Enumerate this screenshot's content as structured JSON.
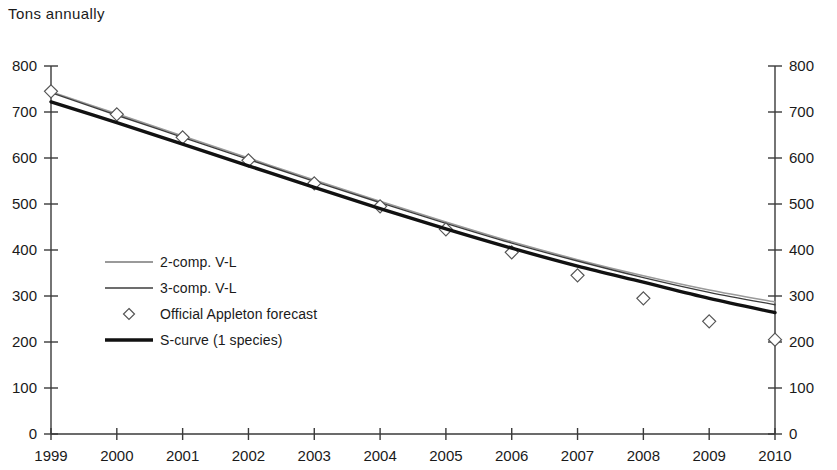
{
  "chart_data": {
    "type": "line",
    "title": "Tons annually",
    "xlabel": "",
    "ylabel": "Tons annually",
    "x": [
      1999,
      2000,
      2001,
      2002,
      2003,
      2004,
      2005,
      2006,
      2007,
      2008,
      2009,
      2010
    ],
    "categories": [
      "1999",
      "2000",
      "2001",
      "2002",
      "2003",
      "2004",
      "2005",
      "2006",
      "2007",
      "2008",
      "2009",
      "2010"
    ],
    "ylim": [
      0,
      800
    ],
    "ytick_values": [
      0,
      100,
      200,
      300,
      400,
      500,
      600,
      700,
      800
    ],
    "ytick_labels_left": [
      "0",
      "100",
      "200",
      "300",
      "400",
      "500",
      "600",
      "700",
      "800"
    ],
    "ytick_labels_right": [
      "0",
      "100",
      "200",
      "300",
      "400",
      "500",
      "600",
      "700",
      "800"
    ],
    "right_axis": true,
    "grid": false,
    "legend_position": "inside-left",
    "series": [
      {
        "name": "2-comp. V-L",
        "style": "line",
        "color": "#9a9a9a",
        "width": 1.6,
        "marker": "none",
        "values": [
          744,
          696,
          648,
          600,
          552,
          506,
          461,
          418,
          379,
          344,
          313,
          287
        ]
      },
      {
        "name": "3-comp. V-L",
        "style": "line",
        "color": "#3c3c3c",
        "width": 1.4,
        "marker": "none",
        "values": [
          742,
          693,
          645,
          597,
          549,
          503,
          458,
          415,
          376,
          340,
          308,
          281
        ]
      },
      {
        "name": "Official Appleton forecast",
        "style": "marker",
        "color": "#555555",
        "width": 1.0,
        "marker": "diamond",
        "values": [
          745,
          695,
          645,
          595,
          545,
          495,
          445,
          395,
          345,
          295,
          245,
          205
        ]
      },
      {
        "name": "S-curve (1 species)",
        "style": "line",
        "color": "#111111",
        "width": 3.4,
        "marker": "none",
        "values": [
          722,
          677,
          630,
          583,
          536,
          490,
          446,
          404,
          365,
          330,
          295,
          264
        ]
      }
    ],
    "legend_entries": [
      {
        "label": "2-comp. V-L",
        "swatch": "line-thin-grey"
      },
      {
        "label": "3-comp. V-L",
        "swatch": "line-thin-dark"
      },
      {
        "label": "Official Appleton forecast",
        "swatch": "diamond-marker"
      },
      {
        "label": "S-curve (1 species)",
        "swatch": "line-thick-black"
      }
    ]
  },
  "colors": {
    "axis": "#3a3a3a",
    "text": "#1a1a1a",
    "series_2comp": "#9a9a9a",
    "series_3comp": "#3c3c3c",
    "series_scurve": "#111111",
    "marker_stroke": "#555555",
    "background": "#ffffff"
  }
}
